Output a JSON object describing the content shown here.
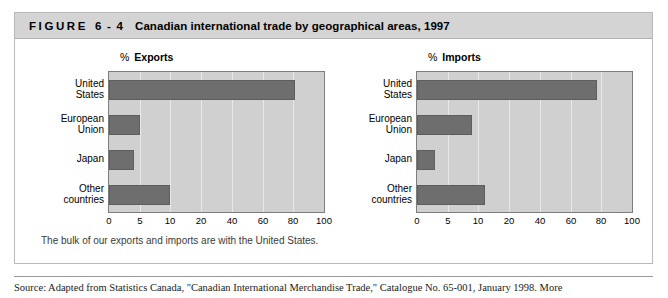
{
  "figure": {
    "label_word": "FIGURE",
    "label_number": "6 - 4",
    "title": "Canadian international trade by geographical areas, 1997",
    "caption": "The bulk of our exports and imports are with the United States.",
    "source": "Source: Adapted from Statistics Canada, \"Canadian International Merchandise Trade,\" Catalogue No. 65-001, January 1998. More"
  },
  "colors": {
    "header_bg": "#d4d4d4",
    "plot_bg": "#d0d0d0",
    "bar": "#6e6e6e",
    "gridline": "#e8e8e8",
    "frame": "#7d7d7d"
  },
  "chart_data": [
    {
      "type": "bar",
      "orientation": "horizontal",
      "title": "Exports",
      "unit_prefix": "%",
      "xlabel": "",
      "ylabel": "",
      "categories": [
        "United States",
        "European Union",
        "Japan",
        "Other countries"
      ],
      "values": [
        81,
        5,
        4,
        10
      ],
      "ticks": [
        0,
        5,
        10,
        20,
        40,
        60,
        80,
        100
      ],
      "tick_labels": [
        "0",
        "5",
        "10",
        "20",
        "40",
        "60",
        "80",
        "100"
      ],
      "xlim": [
        0,
        100
      ],
      "grid": true,
      "legend": "none"
    },
    {
      "type": "bar",
      "orientation": "horizontal",
      "title": "Imports",
      "unit_prefix": "%",
      "xlabel": "",
      "ylabel": "",
      "categories": [
        "United States",
        "European Union",
        "Japan",
        "Other countries"
      ],
      "values": [
        77,
        9,
        3,
        12
      ],
      "ticks": [
        0,
        5,
        10,
        20,
        40,
        60,
        80,
        100
      ],
      "tick_labels": [
        "0",
        "5",
        "10",
        "20",
        "40",
        "60",
        "80",
        "100"
      ],
      "xlim": [
        0,
        100
      ],
      "grid": true,
      "legend": "none"
    }
  ]
}
